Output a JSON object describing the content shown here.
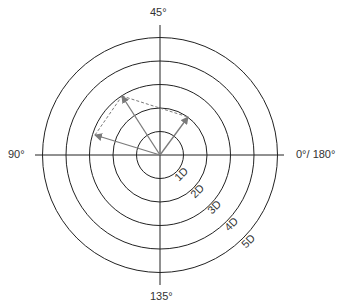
{
  "diagram": {
    "center": [
      160,
      155
    ],
    "ring_radius_step": 23.5,
    "rings": [
      {
        "label": "1D",
        "radius": 23.5
      },
      {
        "label": "2D",
        "radius": 47
      },
      {
        "label": "3D",
        "radius": 70.5
      },
      {
        "label": "4D",
        "radius": 94
      },
      {
        "label": "5D",
        "radius": 117.5
      }
    ],
    "axis_labels": {
      "top": "45°",
      "left": "90°",
      "right": "0°/ 180°",
      "bottom": "135°"
    },
    "vectors": [
      {
        "name": "vector-right",
        "to": [
          188,
          117
        ]
      },
      {
        "name": "vector-upper-left",
        "to": [
          122,
          96
        ]
      },
      {
        "name": "vector-left",
        "to": [
          95,
          135
        ]
      }
    ],
    "dashed_lines": [
      {
        "from": [
          95,
          135
        ],
        "to": [
          122,
          96
        ]
      },
      {
        "from": [
          122,
          96
        ],
        "to": [
          188,
          117
        ]
      }
    ],
    "colors": {
      "rings": "#222222",
      "axes": "#222222",
      "vectors": "#7a7a7a",
      "dashed": "#7a7a7a"
    }
  }
}
